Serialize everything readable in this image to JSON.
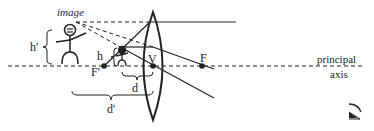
{
  "diagram": {
    "type": "converging-lens-virtual-image",
    "labels": {
      "image": "image",
      "h_prime": "h'",
      "h": "h",
      "F_prime": "F'",
      "V": "V",
      "F": "F",
      "d": "d",
      "d_prime": "d'",
      "principal_line1": "principal",
      "principal_line2": "axis"
    },
    "colors": {
      "stroke": "#222222",
      "background": "#ffffff"
    },
    "points": {
      "F_prime": [
        104,
        66
      ],
      "V": [
        153,
        66
      ],
      "F": [
        202,
        66
      ]
    },
    "elements": [
      "principal-axis",
      "lens",
      "object-figure",
      "image-figure",
      "rays",
      "eye"
    ]
  }
}
